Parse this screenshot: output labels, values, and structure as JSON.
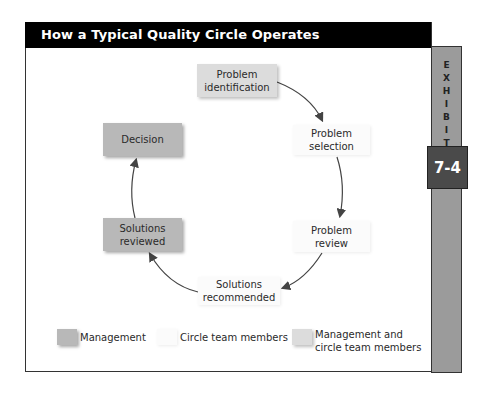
{
  "header": {
    "title": "How a Typical Quality Circle Operates"
  },
  "exhibit": {
    "label": "EXHIBIT",
    "number": "7-4"
  },
  "nodes": [
    {
      "id": "problem-identification",
      "label": "Problem identification",
      "line1": "Problem",
      "line2": "identification",
      "role": "both"
    },
    {
      "id": "problem-selection",
      "label": "Problem selection",
      "line1": "Problem",
      "line2": "selection",
      "role": "team"
    },
    {
      "id": "problem-review",
      "label": "Problem review",
      "line1": "Problem",
      "line2": "review",
      "role": "team"
    },
    {
      "id": "solutions-recommended",
      "label": "Solutions recommended",
      "line1": "Solutions",
      "line2": "recommended",
      "role": "team"
    },
    {
      "id": "solutions-reviewed",
      "label": "Solutions reviewed",
      "line1": "Solutions",
      "line2": "reviewed",
      "role": "management"
    },
    {
      "id": "decision",
      "label": "Decision",
      "line1": "Decision",
      "line2": "",
      "role": "management"
    }
  ],
  "legend": [
    {
      "label": "Management",
      "color": "#b8b8b8"
    },
    {
      "label": "Circle team members",
      "color": "#fbfbfb"
    },
    {
      "label_line1": "Management and",
      "label_line2": "circle team members",
      "color": "#dcdcdc"
    }
  ],
  "colors": {
    "header": "#000000",
    "sidebar": "#9b9b9b",
    "exhibit_box": "#4a4a4a",
    "arrow": "#444444"
  }
}
